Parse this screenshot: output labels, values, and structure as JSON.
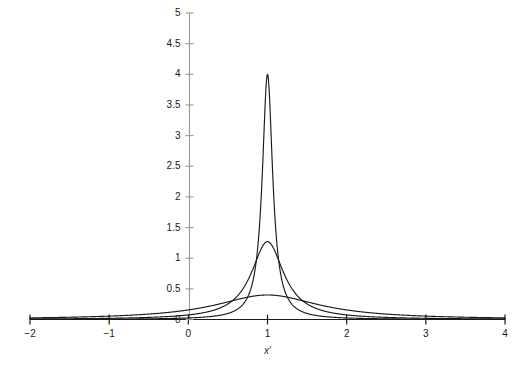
{
  "chart_data": {
    "type": "line",
    "title": "",
    "subtitle": "",
    "xlabel": "x′",
    "ylabel": "",
    "xlim": [
      -2,
      4
    ],
    "ylim": [
      0,
      5
    ],
    "grid": false,
    "legend": null,
    "legend_position": "none",
    "background_color": "#ffffff",
    "line_color": "#1a1a1a",
    "axis_color": "#8c8c8c",
    "x_ticks": [
      -2,
      -1,
      0,
      1,
      2,
      3,
      4
    ],
    "x_tick_labels": [
      "−2",
      "−1",
      "0",
      "1",
      "2",
      "3",
      "4"
    ],
    "y_ticks": [
      0,
      0.5,
      1,
      1.5,
      2,
      2.5,
      3,
      3.5,
      4,
      4.5,
      5
    ],
    "y_tick_labels": [
      "0",
      "0.5",
      "1",
      "1.5",
      "2",
      "2.5",
      "3",
      "3.5",
      "4",
      "4.5",
      "5"
    ],
    "center": 1,
    "series": [
      {
        "name": "narrow",
        "shape": "lorentzian",
        "center": 1,
        "half_width": 0.0795,
        "peak": 4.0,
        "values_at": {
          "0.0": 0.025,
          "0.5": 0.096,
          "0.75": 0.349,
          "0.9": 1.58,
          "0.95": 2.74,
          "1.0": 4.0,
          "1.05": 2.74,
          "1.1": 1.58,
          "1.25": 0.349,
          "1.5": 0.096,
          "2.0": 0.025,
          "3.0": 0.006
        }
      },
      {
        "name": "medium",
        "shape": "lorentzian",
        "center": 1,
        "half_width": 0.25,
        "peak": 1.27,
        "values_at": {
          "-1.0": 0.019,
          "0.0": 0.076,
          "0.5": 0.318,
          "0.75": 0.794,
          "0.9": 1.17,
          "1.0": 1.27,
          "1.1": 1.17,
          "1.25": 0.794,
          "1.5": 0.318,
          "2.0": 0.076,
          "3.0": 0.019,
          "4.0": 0.008
        }
      },
      {
        "name": "broad",
        "shape": "lorentzian",
        "center": 1,
        "half_width": 0.8,
        "peak": 0.4,
        "values_at": {
          "-2.0": 0.035,
          "-1.0": 0.074,
          "0.0": 0.195,
          "0.5": 0.337,
          "0.75": 0.384,
          "1.0": 0.4,
          "1.25": 0.384,
          "1.5": 0.337,
          "2.0": 0.195,
          "3.0": 0.074,
          "4.0": 0.035
        }
      }
    ]
  },
  "axis": {
    "x_title": "x′"
  }
}
